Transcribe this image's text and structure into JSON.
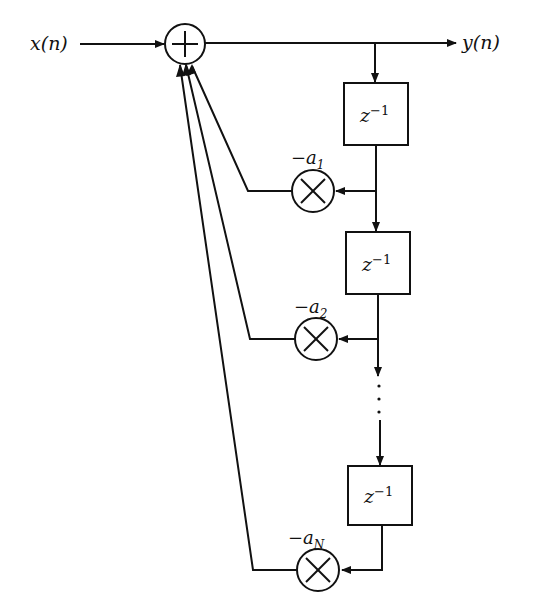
{
  "diagram": {
    "input_label": "x(n)",
    "output_label": "y(n)",
    "adder": {
      "symbol": "+"
    },
    "delays": [
      {
        "label_base": "z",
        "label_exp": "−1"
      },
      {
        "label_base": "z",
        "label_exp": "−1"
      },
      {
        "label_base": "z",
        "label_exp": "−1"
      }
    ],
    "multipliers": [
      {
        "coef_prefix": "−a",
        "coef_sub": "1"
      },
      {
        "coef_prefix": "−a",
        "coef_sub": "2"
      },
      {
        "coef_prefix": "−a",
        "coef_sub": "N"
      }
    ],
    "ellipsis": "⋮",
    "colors": {
      "stroke": "#111111",
      "background": "#ffffff"
    }
  }
}
